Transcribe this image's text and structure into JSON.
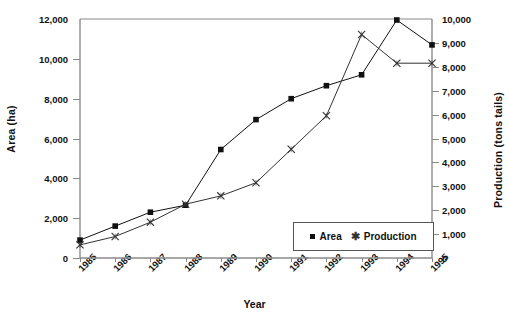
{
  "chart_data": {
    "type": "line",
    "title": "",
    "xlabel": "Year",
    "ylabel": "Area  (ha)",
    "ylabel_right": "Production  (tons tails)",
    "categories": [
      "1985",
      "1986",
      "1987",
      "1988",
      "1989",
      "1990",
      "1991",
      "1992",
      "1993",
      "1994",
      "1995"
    ],
    "ylim": [
      0,
      12000
    ],
    "ylim_right": [
      0,
      10000
    ],
    "yticks": [
      "0",
      "2,000",
      "4,000",
      "6,000",
      "8,000",
      "10,000",
      "12,000"
    ],
    "yticks_right": [
      "0",
      "1,000",
      "2,000",
      "3,000",
      "4,000",
      "5,000",
      "6,000",
      "7,000",
      "8,000",
      "9,000",
      "10,000"
    ],
    "grid": false,
    "legend_position": "bottom-right-inside",
    "series": [
      {
        "name": "Area",
        "axis": "left",
        "marker": "square",
        "color": "#111111",
        "values": [
          900,
          1600,
          2300,
          2650,
          5450,
          6950,
          8000,
          8650,
          9200,
          11950,
          10700
        ]
      },
      {
        "name": "Production",
        "axis": "right",
        "marker": "x-asterisk",
        "color": "#333333",
        "values": [
          550,
          900,
          1500,
          2250,
          2600,
          3150,
          4550,
          5950,
          9350,
          8150,
          8150
        ]
      }
    ]
  },
  "legend": {
    "items": [
      {
        "label": "Area",
        "glyph": "square-marker-icon"
      },
      {
        "label": "Production",
        "glyph": "x-marker-icon"
      }
    ]
  }
}
